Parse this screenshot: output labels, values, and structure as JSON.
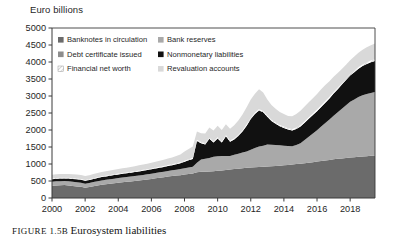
{
  "figure": {
    "caption_prefix": "FIGURE",
    "caption_number": "1.5B",
    "caption_title": "Eurosystem liabilities"
  },
  "colors": {
    "banknotes": "#6b6b6b",
    "bank_reserves": "#a9a9a9",
    "debt_certificate": "#8d8d8d",
    "nonmonetary": "#111111",
    "financial_net_worth": "#ffffff",
    "revaluation": "#d9d9d9",
    "axis": "#3a3a3a",
    "text": "#1f1f1f"
  },
  "legend": {
    "items": [
      {
        "label": "Banknotes in circulation",
        "swatch": "banknotes",
        "swatch_style": "solid-dark-gray"
      },
      {
        "label": "Bank reserves",
        "swatch": "bank_reserves",
        "swatch_style": "solid-mid-gray"
      },
      {
        "label": "Debt certificate issued",
        "swatch": "debt_certificate",
        "swatch_style": "solid-gray"
      },
      {
        "label": "Nonmonetary liabilities",
        "swatch": "nonmonetary",
        "swatch_style": "solid-black"
      },
      {
        "label": "Financial net worth",
        "swatch": "financial_net_worth",
        "swatch_style": "hatched-white"
      },
      {
        "label": "Revaluation accounts",
        "swatch": "revaluation",
        "swatch_style": "solid-light-gray"
      }
    ]
  },
  "chart_data": {
    "type": "area",
    "stacked": true,
    "title": "",
    "subtitle": "",
    "xlabel": "",
    "ylabel": "Euro billions",
    "ylim": [
      0,
      5000
    ],
    "xlim": [
      2000,
      2019.5
    ],
    "grid": false,
    "legend_position": "inside-top-left",
    "y_ticks": [
      0,
      500,
      1000,
      1500,
      2000,
      2500,
      3000,
      3500,
      4000,
      4500,
      5000
    ],
    "y_tick_labels": [
      "0",
      "500",
      "1000",
      "1500",
      "2000",
      "2500",
      "3000",
      "3500",
      "4000",
      "4500",
      "5000"
    ],
    "x_ticks": [
      2000,
      2002,
      2004,
      2006,
      2008,
      2010,
      2012,
      2014,
      2016,
      2018
    ],
    "x_tick_labels": [
      "2000",
      "2002",
      "2004",
      "2006",
      "2008",
      "2010",
      "2012",
      "2014",
      "2016",
      "2018"
    ],
    "x": [
      2000.0,
      2000.25,
      2000.5,
      2000.75,
      2001.0,
      2001.25,
      2001.5,
      2001.75,
      2002.0,
      2002.25,
      2002.5,
      2002.75,
      2003.0,
      2003.25,
      2003.5,
      2003.75,
      2004.0,
      2004.25,
      2004.5,
      2004.75,
      2005.0,
      2005.25,
      2005.5,
      2005.75,
      2006.0,
      2006.25,
      2006.5,
      2006.75,
      2007.0,
      2007.25,
      2007.5,
      2007.75,
      2008.0,
      2008.25,
      2008.5,
      2008.75,
      2009.0,
      2009.25,
      2009.5,
      2009.75,
      2010.0,
      2010.25,
      2010.5,
      2010.75,
      2011.0,
      2011.25,
      2011.5,
      2011.75,
      2012.0,
      2012.25,
      2012.5,
      2012.75,
      2013.0,
      2013.25,
      2013.5,
      2013.75,
      2014.0,
      2014.25,
      2014.5,
      2014.75,
      2015.0,
      2015.25,
      2015.5,
      2015.75,
      2016.0,
      2016.25,
      2016.5,
      2016.75,
      2017.0,
      2017.25,
      2017.5,
      2017.75,
      2018.0,
      2018.25,
      2018.5,
      2018.75,
      2019.0,
      2019.25,
      2019.5
    ],
    "series": [
      {
        "name": "Banknotes in circulation",
        "color_key": "banknotes",
        "values": [
          360,
          370,
          375,
          380,
          370,
          355,
          340,
          330,
          300,
          320,
          345,
          365,
          390,
          405,
          420,
          435,
          450,
          462,
          475,
          488,
          500,
          515,
          530,
          545,
          560,
          578,
          595,
          612,
          630,
          645,
          660,
          672,
          690,
          705,
          720,
          760,
          770,
          775,
          780,
          790,
          800,
          812,
          825,
          838,
          850,
          862,
          875,
          888,
          900,
          908,
          915,
          920,
          930,
          935,
          942,
          950,
          960,
          972,
          985,
          998,
          1010,
          1025,
          1040,
          1055,
          1075,
          1090,
          1105,
          1120,
          1140,
          1152,
          1165,
          1178,
          1190,
          1200,
          1210,
          1220,
          1230,
          1240,
          1250
        ]
      },
      {
        "name": "Bank reserves",
        "color_key": "bank_reserves",
        "values": [
          120,
          122,
          120,
          118,
          120,
          122,
          124,
          122,
          120,
          122,
          124,
          126,
          128,
          130,
          132,
          134,
          136,
          138,
          140,
          142,
          145,
          148,
          150,
          152,
          155,
          158,
          160,
          162,
          165,
          168,
          172,
          178,
          185,
          192,
          200,
          280,
          360,
          380,
          400,
          420,
          430,
          420,
          410,
          400,
          420,
          440,
          460,
          480,
          520,
          560,
          600,
          620,
          640,
          630,
          620,
          600,
          580,
          560,
          540,
          560,
          600,
          680,
          760,
          840,
          920,
          1010,
          1100,
          1190,
          1280,
          1370,
          1460,
          1550,
          1640,
          1700,
          1760,
          1800,
          1830,
          1850,
          1870
        ]
      },
      {
        "name": "Debt certificate issued",
        "color_key": "debt_certificate",
        "values": [
          0,
          0,
          0,
          0,
          0,
          0,
          0,
          0,
          0,
          0,
          0,
          0,
          0,
          0,
          0,
          0,
          0,
          0,
          0,
          0,
          0,
          0,
          0,
          0,
          0,
          0,
          0,
          0,
          0,
          0,
          0,
          0,
          0,
          0,
          0,
          0,
          0,
          0,
          0,
          0,
          0,
          0,
          0,
          0,
          0,
          0,
          0,
          0,
          0,
          0,
          0,
          0,
          0,
          0,
          0,
          0,
          0,
          0,
          0,
          0,
          0,
          0,
          0,
          0,
          0,
          0,
          0,
          0,
          0,
          0,
          0,
          0,
          0,
          0,
          0,
          0,
          0,
          0,
          0
        ]
      },
      {
        "name": "Nonmonetary liabilities",
        "color_key": "nonmonetary",
        "values": [
          70,
          72,
          75,
          78,
          80,
          82,
          85,
          85,
          88,
          90,
          92,
          95,
          98,
          100,
          102,
          105,
          108,
          110,
          112,
          115,
          118,
          120,
          122,
          125,
          128,
          130,
          135,
          140,
          145,
          150,
          160,
          170,
          190,
          210,
          230,
          640,
          480,
          420,
          560,
          420,
          520,
          400,
          580,
          420,
          450,
          520,
          620,
          760,
          900,
          1000,
          1060,
          980,
          820,
          700,
          620,
          560,
          520,
          480,
          460,
          470,
          490,
          510,
          530,
          545,
          560,
          580,
          600,
          620,
          650,
          680,
          710,
          740,
          770,
          800,
          830,
          860,
          880,
          900,
          910
        ]
      },
      {
        "name": "Financial net worth",
        "color_key": "financial_net_worth",
        "values": [
          22,
          22,
          22,
          22,
          22,
          22,
          22,
          22,
          22,
          22,
          22,
          22,
          22,
          22,
          22,
          22,
          24,
          24,
          24,
          24,
          26,
          26,
          26,
          26,
          28,
          28,
          28,
          28,
          30,
          30,
          30,
          30,
          32,
          32,
          32,
          34,
          34,
          34,
          34,
          34,
          36,
          36,
          36,
          36,
          38,
          38,
          38,
          38,
          40,
          40,
          40,
          40,
          40,
          40,
          40,
          40,
          42,
          42,
          42,
          42,
          44,
          44,
          44,
          44,
          46,
          46,
          46,
          46,
          48,
          48,
          48,
          48,
          50,
          50,
          50,
          50,
          52,
          52,
          52
        ]
      },
      {
        "name": "Revaluation accounts",
        "color_key": "revaluation",
        "values": [
          110,
          115,
          112,
          108,
          112,
          118,
          120,
          118,
          115,
          118,
          122,
          125,
          128,
          130,
          132,
          135,
          138,
          140,
          142,
          145,
          148,
          152,
          156,
          160,
          165,
          170,
          175,
          180,
          190,
          200,
          215,
          230,
          270,
          300,
          330,
          240,
          260,
          290,
          300,
          320,
          340,
          330,
          320,
          340,
          380,
          420,
          460,
          500,
          540,
          560,
          580,
          540,
          470,
          430,
          400,
          380,
          370,
          360,
          380,
          400,
          420,
          430,
          440,
          450,
          460,
          470,
          470,
          460,
          450,
          430,
          410,
          400,
          400,
          410,
          420,
          430,
          440,
          450,
          460
        ]
      }
    ]
  }
}
